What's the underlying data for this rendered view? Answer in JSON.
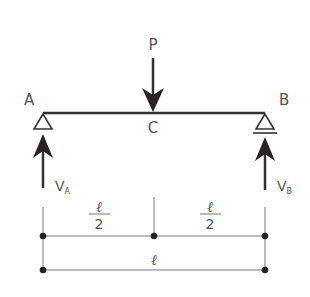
{
  "diagram": {
    "type": "simply-supported-beam-with-central-point-load",
    "load": {
      "label": "P",
      "position_label": "C"
    },
    "supports": [
      {
        "label": "A",
        "reaction_label": "V",
        "reaction_subscript": "A",
        "type": "pin"
      },
      {
        "label": "B",
        "reaction_label": "V",
        "reaction_subscript": "B",
        "type": "roller"
      }
    ],
    "dimensions": {
      "half_span_numerator": "ℓ",
      "half_span_denominator": "2",
      "full_span": "ℓ"
    },
    "colors": {
      "line": "#333333",
      "text": "#555555",
      "dim_line": "#777777"
    }
  }
}
